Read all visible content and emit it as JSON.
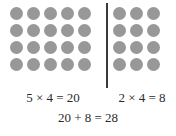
{
  "diagram": {
    "colors": {
      "dot": "#989898",
      "divider": "#3a3a3a",
      "text": "#2b2b2b",
      "background": "#ffffff"
    },
    "rows": 4,
    "left_group": {
      "columns": 5,
      "rows": 4,
      "equation": "5 × 4 = 20"
    },
    "right_group": {
      "columns": 3,
      "rows": 4,
      "equation": "2 × 4 = 8"
    },
    "total_equation": "20 + 8 = 28",
    "divider_label": "vertical-divider"
  },
  "chart_data": {
    "type": "table",
    "categories": [
      "left group",
      "right group"
    ],
    "series": [
      {
        "name": "columns",
        "values": [
          5,
          3
        ]
      },
      {
        "name": "rows",
        "values": [
          4,
          4
        ]
      }
    ],
    "annotations": [
      "5 × 4 = 20",
      "2 × 4 = 8",
      "20 + 8 = 28"
    ],
    "xlabel": "",
    "ylabel": ""
  }
}
